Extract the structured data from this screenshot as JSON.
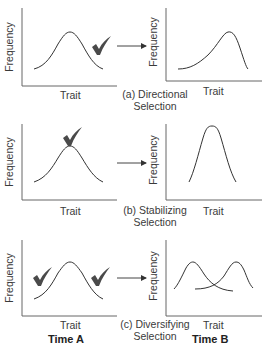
{
  "figure": {
    "colors": {
      "axis": "#555555",
      "curve": "#333333",
      "check": "#444444",
      "text": "#3a3a3a"
    },
    "axis_labels": {
      "x": "Trait",
      "y": "Frequency"
    },
    "panels": [
      {
        "id": "a",
        "caption_line1": "(a) Directional",
        "caption_line2": "Selection",
        "before": {
          "x_label": "Trait",
          "y_label": "Frequency",
          "curve": "symmetric bell",
          "checkmarks": [
            "right tail"
          ]
        },
        "after": {
          "x_label": "Trait",
          "y_label": "Frequency",
          "curve": "bell skewed right (peak shifted right)"
        }
      },
      {
        "id": "b",
        "caption_line1": "(b) Stabilizing",
        "caption_line2": "Selection",
        "before": {
          "x_label": "Trait",
          "y_label": "Frequency",
          "curve": "symmetric bell",
          "checkmarks": [
            "peak"
          ]
        },
        "after": {
          "x_label": "Trait",
          "y_label": "Frequency",
          "curve": "narrow tall bell"
        }
      },
      {
        "id": "c",
        "caption_line1": "(c) Diversifying",
        "caption_line2": "Selection",
        "before": {
          "x_label": "Trait",
          "y_label": "Frequency",
          "curve": "symmetric bell",
          "checkmarks": [
            "left tail",
            "right tail"
          ]
        },
        "after": {
          "x_label": "Trait",
          "y_label": "Frequency",
          "curve": "two overlapping bells (bimodal)"
        }
      }
    ],
    "column_labels": {
      "left": "Time A",
      "right": "Time B"
    }
  }
}
